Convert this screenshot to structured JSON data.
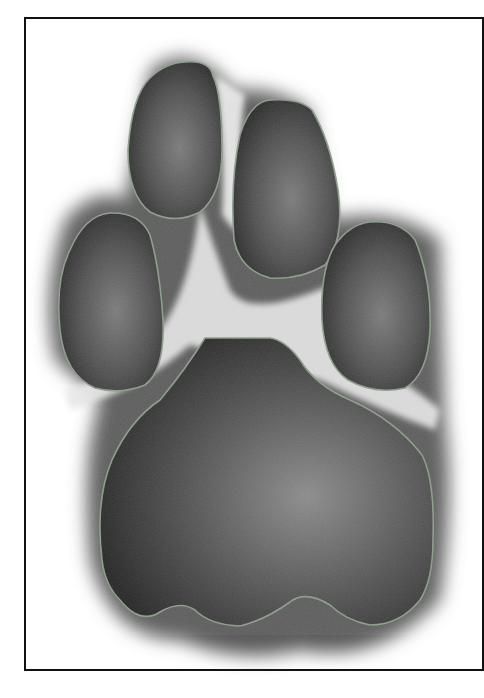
{
  "figure": {
    "colors": {
      "frame": "#111111",
      "background": "#ffffff",
      "pad_dark": "#2a2a2a",
      "pad_mid": "#5a5a5a",
      "pad_light": "#8a8a8a",
      "fur": "#d8d8d8",
      "outline": "#8a9a88"
    },
    "pads": [
      {
        "name": "digital-pad-2",
        "label": "Digital pad (upper left)"
      },
      {
        "name": "digital-pad-3",
        "label": "Digital pad (upper right)"
      },
      {
        "name": "digital-pad-1",
        "label": "Digital pad (left)"
      },
      {
        "name": "digital-pad-4",
        "label": "Digital pad (right)"
      },
      {
        "name": "metacarpal-pad",
        "label": "Metacarpal pad"
      }
    ]
  }
}
